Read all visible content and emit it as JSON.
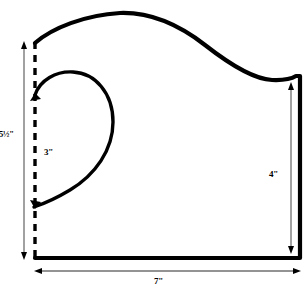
{
  "diagram": {
    "type": "technical-line-drawing",
    "background_color": "#ffffff",
    "line_color": "#000000",
    "dimensions": {
      "total_height": "5½\"",
      "total_height_parts": {
        "whole": "5",
        "fraction": "½",
        "unit": "\""
      },
      "inner_segment": "3\"",
      "right_height": "4\"",
      "total_width": "7\""
    },
    "elements": {
      "outline_name": "pattern-outline",
      "fold_line_name": "fold-line-dashed",
      "applique_name": "paisley-applique-outline"
    }
  }
}
